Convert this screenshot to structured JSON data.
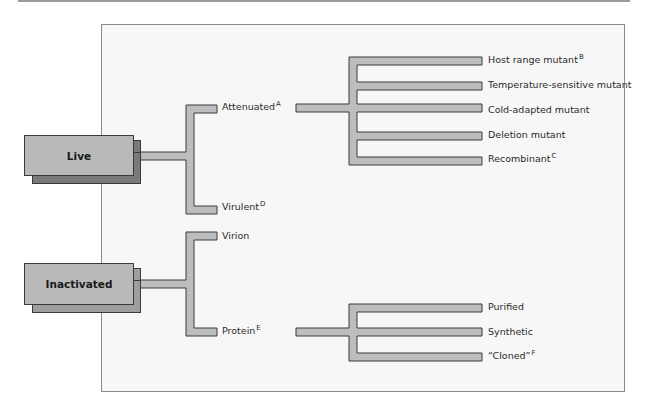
{
  "diagram": {
    "categories": [
      {
        "label": "Live",
        "branches": [
          {
            "label": "Attenuated",
            "footnote": "A",
            "children": [
              {
                "label": "Host range mutant",
                "footnote": "B"
              },
              {
                "label": "Temperature-sensitive mutant",
                "footnote": ""
              },
              {
                "label": "Cold-adapted mutant",
                "footnote": ""
              },
              {
                "label": "Deletion mutant",
                "footnote": ""
              },
              {
                "label": "Recombinant",
                "footnote": "C"
              }
            ]
          },
          {
            "label": "Virulent",
            "footnote": "D",
            "children": []
          }
        ]
      },
      {
        "label": "Inactivated",
        "branches": [
          {
            "label": "Virion",
            "footnote": "",
            "children": []
          },
          {
            "label": "Protein",
            "footnote": "E",
            "children": [
              {
                "label": "Purified",
                "footnote": ""
              },
              {
                "label": "Synthetic",
                "footnote": ""
              },
              {
                "label": "“Cloned”",
                "footnote": "F"
              }
            ]
          }
        ]
      }
    ]
  },
  "colors": {
    "box_fill": "#b9b9b9",
    "box_shadow": "#7a7a7a",
    "connector_fill": "#bdbdbd",
    "outline": "#3a3a3a",
    "panel_bg": "#f7f7f7"
  }
}
